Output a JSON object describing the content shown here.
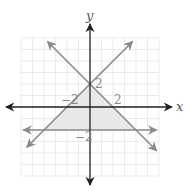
{
  "chart_data": {
    "type": "line",
    "title": "",
    "xlabel": "x",
    "ylabel": "y",
    "xlim": [
      -6,
      6
    ],
    "ylim": [
      -6,
      6
    ],
    "grid": true,
    "tick_labels": {
      "x": [
        {
          "value": -2,
          "label": "−2"
        },
        {
          "value": 2,
          "label": "2"
        }
      ],
      "y": [
        {
          "value": 2,
          "label": "2"
        },
        {
          "value": -2,
          "label": "−2"
        }
      ]
    },
    "series": [
      {
        "name": "y = x + 2",
        "slope": 1,
        "intercept": 2,
        "x_range": [
          -5.5,
          5.5
        ]
      },
      {
        "name": "y = -x + 2",
        "slope": -1,
        "intercept": 2,
        "x_range": [
          -5.5,
          5.8
        ]
      },
      {
        "name": "y = -2",
        "slope": 0,
        "intercept": -2,
        "x_range": [
          -5.8,
          5.8
        ]
      }
    ],
    "shaded_region": {
      "description": "triangle bounded by the three lines",
      "vertices": [
        [
          0,
          2
        ],
        [
          -4,
          -2
        ],
        [
          4,
          -2
        ]
      ],
      "color": "#e8e8e8"
    },
    "colors": {
      "axis": "#222222",
      "line": "#8a8a8a",
      "grid": "#e6e6e6"
    }
  }
}
